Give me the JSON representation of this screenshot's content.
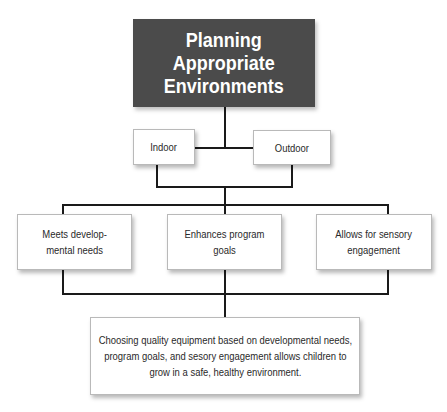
{
  "title": {
    "line1": "Planning",
    "line2": "Appropriate",
    "line3": "Environments"
  },
  "level2": [
    {
      "label": "Indoor"
    },
    {
      "label": "Outdoor"
    }
  ],
  "level3": [
    {
      "line1": "Meets develop-",
      "line2": "mental needs"
    },
    {
      "line1": "Enhances program",
      "line2": "goals"
    },
    {
      "line1": "Allows for sensory",
      "line2": "engagement"
    }
  ],
  "conclusion": {
    "line1": "Choosing quality equipment based on developmental needs,",
    "line2": "program goals, and sesory engagement allows children to",
    "line3": "grow in a safe, healthy environment."
  },
  "colors": {
    "title_bg": "#4b4b4b",
    "title_text": "#ffffff",
    "line": "#1a1a1a",
    "box_border": "#b9b9b9"
  }
}
